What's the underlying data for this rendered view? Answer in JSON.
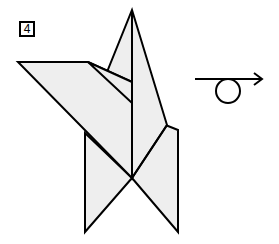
{
  "step": {
    "number": "4"
  },
  "colors": {
    "paper_fill": "#eeeeee",
    "stroke": "#000000",
    "background": "#ffffff"
  },
  "symbols": {
    "turn_over_icon": "turn-over-horizontal-arrow-with-loop"
  }
}
